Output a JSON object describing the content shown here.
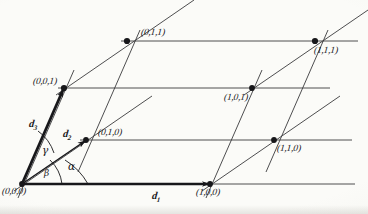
{
  "figure": {
    "type": "crystallographic-unit-cell",
    "ink_color": "#17171a",
    "thin_line_color": "#3a3a3c",
    "paper_color": "#fbfbf8"
  },
  "vectors": [
    {
      "id": "d1",
      "label": "d",
      "sub": "1",
      "x": 152,
      "y": 190
    },
    {
      "id": "d2",
      "label": "d",
      "sub": "2",
      "x": 63,
      "y": 128
    },
    {
      "id": "d3",
      "label": "d",
      "sub": "3",
      "x": 29,
      "y": 118
    }
  ],
  "angles": [
    {
      "id": "alpha",
      "symbol": "α",
      "x": 68,
      "y": 160
    },
    {
      "id": "beta",
      "symbol": "β",
      "x": 44,
      "y": 168
    },
    {
      "id": "gamma",
      "symbol": "γ",
      "x": 42,
      "y": 144
    }
  ],
  "vertices": [
    {
      "id": "v000",
      "label": "(0,0,0)",
      "px": 22,
      "py": 184,
      "lx": 2,
      "ly": 186,
      "dot": false
    },
    {
      "id": "v100",
      "label": "(1,0,0)",
      "px": 210,
      "py": 184,
      "lx": 196,
      "ly": 187,
      "dot": true
    },
    {
      "id": "v010",
      "label": "(0,1,0)",
      "px": 86,
      "py": 140,
      "lx": 98,
      "ly": 127,
      "dot": true
    },
    {
      "id": "v110",
      "label": "(1,1,0)",
      "px": 274,
      "py": 140,
      "lx": 277,
      "ly": 143,
      "dot": true
    },
    {
      "id": "v001",
      "label": "(0,0,1)",
      "px": 64,
      "py": 88,
      "lx": 33,
      "ly": 76,
      "dot": true
    },
    {
      "id": "v101",
      "label": "(1,0,1)",
      "px": 252,
      "py": 88,
      "lx": 224,
      "ly": 92,
      "dot": true
    },
    {
      "id": "v011",
      "label": "(0,1,1)",
      "px": 127,
      "py": 41,
      "lx": 141,
      "ly": 27,
      "dot": true
    },
    {
      "id": "v111",
      "label": "(1,1,1)",
      "px": 315,
      "py": 41,
      "lx": 314,
      "ly": 45,
      "dot": true
    }
  ]
}
